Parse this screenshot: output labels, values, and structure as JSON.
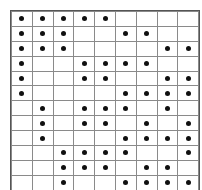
{
  "figure": {
    "name": "dot-grid-pattern",
    "columns": 9,
    "rows": 12,
    "dots_per_row": 5,
    "grid_line_color": "#8a8a8a",
    "dot_color": "#101010",
    "background_color": "#ffffff"
  },
  "chart_data": {
    "type": "heatmap",
    "title": "",
    "subtitle": "",
    "xlabel": "",
    "ylabel": "",
    "legend": [],
    "annotations": [],
    "grid": true,
    "columns": 9,
    "rows": 12,
    "column_labels": [
      "1",
      "2",
      "3",
      "4",
      "5",
      "6",
      "7",
      "8",
      "9"
    ],
    "row_labels": [
      "1",
      "2",
      "3",
      "4",
      "5",
      "6",
      "7",
      "8",
      "9",
      "10",
      "11",
      "12"
    ],
    "value_legend": {
      "1": "filled dot",
      "0": "empty cell"
    },
    "matrix": [
      [
        1,
        1,
        1,
        1,
        1,
        0,
        0,
        0,
        0
      ],
      [
        1,
        1,
        1,
        0,
        0,
        1,
        1,
        0,
        0
      ],
      [
        1,
        1,
        1,
        0,
        0,
        0,
        0,
        1,
        1
      ],
      [
        1,
        0,
        0,
        1,
        1,
        1,
        1,
        0,
        0
      ],
      [
        1,
        0,
        0,
        1,
        1,
        0,
        0,
        1,
        1
      ],
      [
        1,
        0,
        0,
        0,
        0,
        1,
        1,
        1,
        1
      ],
      [
        0,
        1,
        0,
        1,
        1,
        1,
        0,
        1,
        0
      ],
      [
        0,
        1,
        0,
        1,
        1,
        0,
        1,
        0,
        1
      ],
      [
        0,
        1,
        0,
        0,
        0,
        1,
        1,
        1,
        1
      ],
      [
        0,
        0,
        1,
        1,
        1,
        1,
        0,
        0,
        1
      ],
      [
        0,
        0,
        1,
        1,
        1,
        0,
        1,
        1,
        0
      ],
      [
        0,
        0,
        1,
        0,
        0,
        1,
        1,
        1,
        1
      ]
    ],
    "row_dot_columns": [
      [
        1,
        2,
        3,
        4,
        5
      ],
      [
        1,
        2,
        3,
        6,
        7
      ],
      [
        1,
        2,
        3,
        8,
        9
      ],
      [
        1,
        4,
        5,
        6,
        7
      ],
      [
        1,
        4,
        5,
        8,
        9
      ],
      [
        1,
        6,
        7,
        8,
        9
      ],
      [
        2,
        4,
        5,
        6,
        8
      ],
      [
        2,
        4,
        5,
        7,
        9
      ],
      [
        2,
        6,
        7,
        8,
        9
      ],
      [
        3,
        4,
        5,
        6,
        9
      ],
      [
        3,
        4,
        5,
        7,
        8
      ],
      [
        3,
        6,
        7,
        8,
        9
      ]
    ],
    "column_dot_counts": [
      6,
      6,
      6,
      6,
      6,
      7,
      7,
      7,
      7
    ],
    "row_dot_counts": [
      5,
      5,
      5,
      5,
      5,
      5,
      5,
      5,
      5,
      5,
      5,
      5
    ],
    "total_dots": 60
  }
}
